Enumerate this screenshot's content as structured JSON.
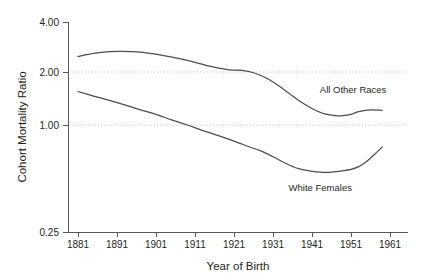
{
  "chart_data": {
    "type": "line",
    "title": "",
    "subtitle": "",
    "xlabel": "Year of Birth",
    "ylabel": "Cohort Mortality Ratio",
    "yscale": "log",
    "ylim": [
      0.25,
      4.0
    ],
    "xlim": [
      1877,
      1963
    ],
    "grid": "horizontal dotted gridlines at 1.00 and 2.00",
    "gridlines": [
      1.0,
      2.0
    ],
    "legend": "inline series labels placed next to curves",
    "xticks": [
      1881,
      1891,
      1901,
      1911,
      1921,
      1931,
      1941,
      1951,
      1961
    ],
    "xtick_labels": [
      "1881",
      "1891",
      "1901",
      "1911",
      "1921",
      "1931",
      "1941",
      "1951",
      "1961"
    ],
    "yticks": [
      0.25,
      1.0,
      2.0,
      4.0
    ],
    "ytick_labels": [
      "0.25",
      "1.00",
      "2.00",
      "4.00"
    ],
    "series": [
      {
        "name": "All Other Races",
        "label": "All Other Races",
        "color": "#4d4d4f",
        "label_position": {
          "x": 1943,
          "y": 1.52
        },
        "x": [
          1881,
          1885,
          1889,
          1892,
          1895,
          1899,
          1903,
          1907,
          1911,
          1915,
          1919,
          1921,
          1923,
          1926,
          1929,
          1932,
          1935,
          1938,
          1941,
          1944,
          1947,
          1949,
          1951,
          1953,
          1956,
          1959
        ],
        "values": [
          2.45,
          2.55,
          2.61,
          2.62,
          2.61,
          2.56,
          2.48,
          2.38,
          2.27,
          2.15,
          2.07,
          2.05,
          2.04,
          1.98,
          1.86,
          1.7,
          1.52,
          1.36,
          1.24,
          1.16,
          1.13,
          1.13,
          1.15,
          1.19,
          1.22,
          1.21
        ]
      },
      {
        "name": "White Females",
        "label": "White Females",
        "color": "#4d4d4f",
        "label_position": {
          "x": 1935,
          "y": 0.42
        },
        "x": [
          1881,
          1885,
          1889,
          1893,
          1897,
          1901,
          1905,
          1909,
          1913,
          1917,
          1921,
          1925,
          1928,
          1931,
          1934,
          1937,
          1940,
          1943,
          1946,
          1949,
          1951,
          1953,
          1955,
          1957,
          1959
        ],
        "values": [
          1.55,
          1.46,
          1.38,
          1.3,
          1.22,
          1.15,
          1.07,
          1.0,
          0.93,
          0.87,
          0.81,
          0.75,
          0.71,
          0.66,
          0.61,
          0.57,
          0.55,
          0.54,
          0.54,
          0.55,
          0.56,
          0.58,
          0.62,
          0.68,
          0.75
        ]
      }
    ]
  },
  "axes": {
    "y_title": "Cohort Mortality Ratio",
    "x_title": "Year of Birth",
    "y_tick_0": "0.25",
    "y_tick_1": "1.00",
    "y_tick_2": "2.00",
    "y_tick_3": "4.00",
    "x_tick_0": "1881",
    "x_tick_1": "1891",
    "x_tick_2": "1901",
    "x_tick_3": "1911",
    "x_tick_4": "1921",
    "x_tick_5": "1931",
    "x_tick_6": "1941",
    "x_tick_7": "1951",
    "x_tick_8": "1961"
  },
  "series_labels": {
    "all_other_races": "All Other Races",
    "white_females": "White Females"
  },
  "colors": {
    "curve": "#4d4d4f",
    "axis": "#58585b",
    "grid": "#b9b9bb",
    "text": "#231f20",
    "background": "#ffffff"
  }
}
